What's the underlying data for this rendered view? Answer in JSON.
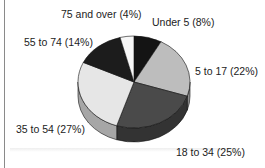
{
  "chart_data": {
    "type": "pie",
    "style": "3d",
    "title": "",
    "categories": [
      "Under 5",
      "5 to 17",
      "18 to 34",
      "35 to 54",
      "55 to 74",
      "75 and over"
    ],
    "values": [
      8,
      22,
      25,
      27,
      14,
      4
    ],
    "unit": "%",
    "labels": [
      "Under 5  (8%)",
      "5 to 17 (22%)",
      "18 to 34 (25%)",
      "35 to 54 (27%)",
      "55 to 74 (14%)",
      "75 and over (4%)"
    ],
    "colors": [
      "#141414",
      "#bdbdbd",
      "#4a4a4a",
      "#e6e6e6",
      "#1c1c1c",
      "#f7f7f7"
    ],
    "side_colors": [
      "#0c0c0c",
      "#8c8c8c",
      "#333333",
      "#a6a6a6",
      "#111111",
      "#cccccc"
    ],
    "start_angle": "12 o'clock",
    "direction": "clockwise",
    "legend": "none (outside labels)"
  }
}
